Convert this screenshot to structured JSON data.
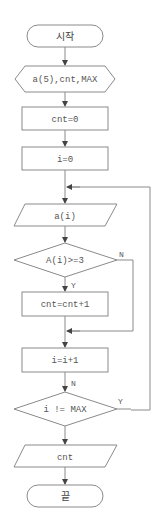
{
  "flowchart": {
    "start": {
      "label": "시작"
    },
    "declare": {
      "label": "a(5),cnt,MAX"
    },
    "init_cnt": {
      "label": "cnt=0"
    },
    "init_i": {
      "label": "i=0"
    },
    "input": {
      "label": "a(i)"
    },
    "cond1": {
      "label": "A(i)>=3",
      "yes": "Y",
      "no": "N"
    },
    "increment_cnt": {
      "label": "cnt=cnt+1"
    },
    "increment_i": {
      "label": "i=i+1",
      "edge_label": "N"
    },
    "cond2": {
      "label": "i != MAX",
      "yes": "Y"
    },
    "output": {
      "label": "cnt"
    },
    "end": {
      "label": "끝"
    }
  },
  "colors": {
    "stroke": "#8a8a8a",
    "text": "#555555",
    "background": "#ffffff"
  }
}
